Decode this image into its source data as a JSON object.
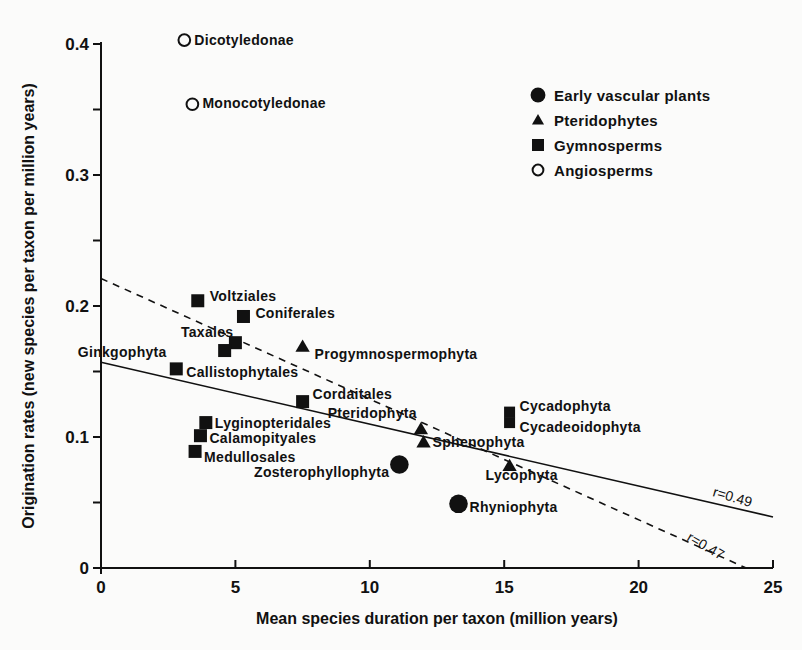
{
  "chart_data": {
    "type": "scatter",
    "title": "",
    "xlabel": "Mean species duration per taxon (million years)",
    "ylabel": "Origination rates (new species per taxon per million years)",
    "xlim": [
      0,
      25
    ],
    "ylim": [
      0,
      0.4
    ],
    "x_ticks": [
      0,
      5,
      10,
      15,
      20,
      25
    ],
    "x_tick_labels": [
      "0",
      "5",
      "10",
      "15",
      "20",
      "25"
    ],
    "y_ticks": [
      0,
      0.1,
      0.2,
      0.3,
      0.4
    ],
    "y_tick_labels": [
      "0",
      "0.1",
      "0.2",
      "0.3",
      "0.4"
    ],
    "y_minor_ticks": [
      0.05,
      0.15,
      0.25,
      0.35
    ],
    "grid": false,
    "legend_position": "upper right",
    "legend": [
      {
        "name": "Early vascular plants",
        "marker": "filled-circle"
      },
      {
        "name": "Pteridophytes",
        "marker": "filled-triangle"
      },
      {
        "name": "Gymnosperms",
        "marker": "filled-square"
      },
      {
        "name": "Angiosperms",
        "marker": "open-circle"
      }
    ],
    "series": [
      {
        "name": "Early vascular plants",
        "marker": "filled-circle",
        "points": [
          {
            "label": "Zosterophyllophyta",
            "x": 11.1,
            "y": 0.079
          },
          {
            "label": "Rhyniophyta",
            "x": 13.3,
            "y": 0.049
          }
        ]
      },
      {
        "name": "Pteridophytes",
        "marker": "filled-triangle",
        "points": [
          {
            "label": "Progymnospermophyta",
            "x": 7.5,
            "y": 0.169
          },
          {
            "label": "Pteridophyta",
            "x": 11.9,
            "y": 0.106
          },
          {
            "label": "Sphenophyta",
            "x": 12.0,
            "y": 0.096
          },
          {
            "label": "Lycophyta",
            "x": 15.2,
            "y": 0.078
          }
        ]
      },
      {
        "name": "Gymnosperms",
        "marker": "filled-square",
        "points": [
          {
            "label": "Voltziales",
            "x": 3.6,
            "y": 0.204
          },
          {
            "label": "Coniferales",
            "x": 5.3,
            "y": 0.192
          },
          {
            "label": "Taxales",
            "x": 5.0,
            "y": 0.172
          },
          {
            "label": "Ginkgophyta",
            "x": 4.6,
            "y": 0.166
          },
          {
            "label": "Callistophytales",
            "x": 2.8,
            "y": 0.152
          },
          {
            "label": "Cordaitales",
            "x": 7.5,
            "y": 0.127
          },
          {
            "label": "Lyginopteridales",
            "x": 3.9,
            "y": 0.111
          },
          {
            "label": "Calamopityales",
            "x": 3.7,
            "y": 0.101
          },
          {
            "label": "Medullosales",
            "x": 3.5,
            "y": 0.089
          },
          {
            "label": "Cycadophyta",
            "x": 15.2,
            "y": 0.119
          },
          {
            "label": "Cycadeoidophyta",
            "x": 15.2,
            "y": 0.111
          }
        ]
      },
      {
        "name": "Angiosperms",
        "marker": "open-circle",
        "points": [
          {
            "label": "Dicotyledonae",
            "x": 3.1,
            "y": 0.403
          },
          {
            "label": "Monocotyledonae",
            "x": 3.4,
            "y": 0.354
          }
        ]
      }
    ],
    "regression_lines": [
      {
        "style": "solid",
        "label": "r=0.49",
        "x1": 0,
        "y1": 0.157,
        "x2": 25,
        "y2": 0.039
      },
      {
        "style": "dashed",
        "label": "r=0.47",
        "x1": 0,
        "y1": 0.221,
        "x2": 24.0,
        "y2": 0.0
      }
    ]
  }
}
